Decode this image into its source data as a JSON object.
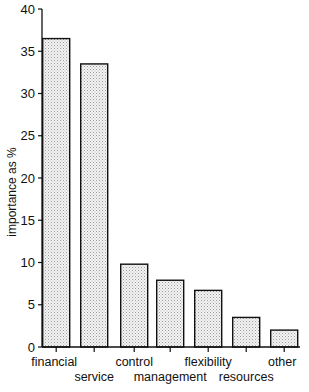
{
  "chart_data": {
    "type": "bar",
    "title": "",
    "xlabel": "",
    "ylabel": "importance as %",
    "ylim": [
      0,
      40
    ],
    "yticks": [
      0,
      5,
      10,
      15,
      20,
      25,
      30,
      35,
      40
    ],
    "grid": false,
    "legend": null,
    "categories": [
      "financial",
      "service",
      "control",
      "management",
      "flexibility",
      "resources",
      "other"
    ],
    "values": [
      36.5,
      33.5,
      9.8,
      7.9,
      6.7,
      3.5,
      2.0
    ],
    "bar_fill": "#e6e6e6",
    "bar_stroke": "#111111"
  }
}
